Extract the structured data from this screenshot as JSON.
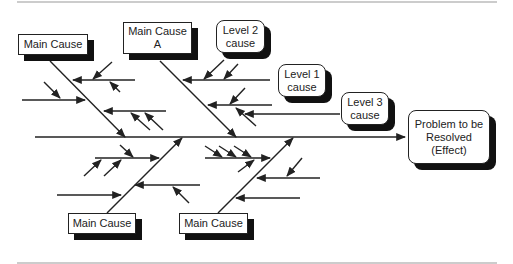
{
  "diagram": {
    "type": "fishbone",
    "effect": {
      "label": "Problem to be Resolved (Effect)",
      "line1": "Problem to be",
      "line2": "Resolved",
      "line3": "(Effect)"
    },
    "main_causes": {
      "top_left": {
        "label": "Main Cause"
      },
      "top_right": {
        "line1": "Main Cause",
        "line2": "A"
      },
      "bottom_left": {
        "label": "Main Cause"
      },
      "bottom_right": {
        "label": "Main Cause"
      }
    },
    "callouts": {
      "level2": {
        "line1": "Level 2",
        "line2": "cause"
      },
      "level1": {
        "line1": "Level 1",
        "line2": "cause"
      },
      "level3": {
        "line1": "Level 3",
        "line2": "cause"
      }
    },
    "colors": {
      "line": "#222222",
      "shadow": "#111111",
      "background": "#ffffff"
    }
  }
}
